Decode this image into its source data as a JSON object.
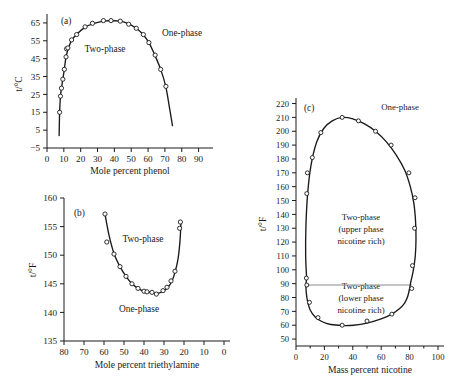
{
  "figure": {
    "caption": "",
    "panels": [
      "a",
      "b",
      "c"
    ]
  },
  "chart_data": [
    {
      "id": "a",
      "panel_label": "(a)",
      "type": "line",
      "title": "",
      "xlabel": "Mole percent phenol",
      "ylabel": "t/°C",
      "xlim": [
        0,
        95
      ],
      "ylim": [
        -5,
        70
      ],
      "xticks": [
        0,
        10,
        20,
        30,
        40,
        50,
        60,
        70,
        80,
        90
      ],
      "yticks": [
        -5,
        5,
        15,
        25,
        35,
        45,
        55,
        65
      ],
      "ytick_labels": [
        "−5",
        "5",
        "15",
        "25",
        "35",
        "45",
        "55",
        "65"
      ],
      "grid": false,
      "legend": "none",
      "annotations": [
        {
          "text": "Two-phase",
          "x": 32,
          "y": 46
        },
        {
          "text": "One-phase",
          "x": 74,
          "y": 55
        }
      ],
      "series": [
        {
          "name": "phenol-water coexistence curve",
          "x": [
            7.2,
            7.5,
            8.0,
            8.6,
            9.3,
            10.2,
            11.2,
            12.4,
            14.5,
            17.5,
            22.5,
            27.0,
            33.5,
            38.0,
            43.5,
            48.5,
            53.0,
            57.0,
            60.5,
            64.0,
            67.5,
            70.5,
            73.0,
            74.5
          ],
          "y": [
            2.0,
            15.0,
            24.0,
            28.5,
            33.0,
            38.5,
            45.5,
            50.0,
            55.0,
            58.5,
            62.5,
            64.5,
            66.0,
            66.2,
            66.0,
            64.5,
            62.0,
            58.5,
            54.0,
            47.0,
            39.0,
            29.5,
            16.0,
            7.5
          ]
        }
      ],
      "data_points": {
        "x": [
          7.5,
          8.0,
          8.6,
          9.4,
          10.3,
          11.3,
          11.6,
          12.4,
          14.6,
          17.6,
          22.6,
          27.0,
          33.5,
          38.0,
          43.5,
          48.5,
          53.0,
          57.2,
          60.5,
          64.2,
          67.5,
          70.6
        ],
        "y": [
          15.0,
          24.0,
          28.5,
          33.5,
          39.0,
          46.0,
          50.5,
          51.0,
          55.5,
          58.5,
          62.8,
          64.8,
          66.3,
          66.3,
          66.0,
          64.3,
          62.0,
          58.5,
          54.0,
          47.0,
          39.0,
          29.5
        ]
      }
    },
    {
      "id": "b",
      "panel_label": "(b)",
      "type": "line",
      "title": "",
      "xlabel": "Mole percent triethylamine",
      "ylabel": "t/°F",
      "xlim": [
        80,
        0
      ],
      "ylim": [
        135,
        160
      ],
      "xticks": [
        80,
        70,
        60,
        50,
        40,
        30,
        20,
        10,
        0
      ],
      "yticks": [
        135,
        140,
        145,
        150,
        155,
        160
      ],
      "x_axis_reversed": true,
      "grid": false,
      "legend": "none",
      "annotations": [
        {
          "text": "Two-phase",
          "x": 42,
          "y": 152.2
        },
        {
          "text": "One-phase",
          "x": 40,
          "y": 140.3
        }
      ],
      "series": [
        {
          "name": "triethylamine-water coexistence curve",
          "x": [
            59.5,
            57.5,
            55.0,
            52.0,
            49.0,
            46.0,
            43.0,
            40.0,
            36.5,
            33.5,
            30.5,
            28.0,
            26.0,
            24.5,
            23.0,
            22.0,
            21.5
          ],
          "y": [
            157.2,
            153.5,
            150.3,
            148.0,
            146.3,
            145.0,
            144.2,
            143.7,
            143.5,
            143.3,
            143.7,
            144.4,
            145.5,
            147.0,
            149.3,
            152.5,
            155.8
          ]
        }
      ],
      "data_points": {
        "x": [
          59.5,
          58.6,
          55.0,
          52.0,
          49.0,
          46.0,
          43.0,
          40.0,
          38.5,
          36.0,
          33.8,
          30.5,
          28.5,
          26.5,
          24.5,
          22.2,
          21.8
        ],
        "y": [
          157.2,
          152.3,
          150.2,
          148.0,
          146.3,
          145.0,
          144.2,
          143.7,
          143.6,
          143.5,
          143.2,
          143.8,
          144.4,
          145.5,
          147.2,
          154.7,
          155.8
        ]
      }
    },
    {
      "id": "c",
      "panel_label": "(c)",
      "type": "line",
      "title": "",
      "xlabel": "Mass percent nicotine",
      "ylabel": "t/°F",
      "xlim": [
        0,
        100
      ],
      "ylim": [
        45,
        224
      ],
      "xticks": [
        0,
        20,
        40,
        60,
        80,
        100
      ],
      "xminorticks": [
        10,
        30,
        50,
        70,
        90
      ],
      "yticks": [
        50,
        60,
        70,
        80,
        90,
        100,
        110,
        120,
        130,
        140,
        150,
        160,
        170,
        180,
        190,
        200,
        210,
        220
      ],
      "grid": false,
      "legend": "none",
      "annotations": [
        {
          "text": "One-phase",
          "x": 72,
          "y": 209
        },
        {
          "text": "Two-phase",
          "x": 44,
          "y": 132
        },
        {
          "text": "(upper phase",
          "x": 44,
          "y": 122
        },
        {
          "text": "nicotine rich)",
          "x": 44,
          "y": 113
        },
        {
          "text": "Two-phase",
          "x": 44,
          "y": 81
        },
        {
          "text": "(lower phase",
          "x": 44,
          "y": 72
        },
        {
          "text": "nicotine rich)",
          "x": 44,
          "y": 63
        }
      ],
      "tie_line": {
        "y": 89,
        "x_start": 7.5,
        "x_end": 81.5
      },
      "series": [
        {
          "name": "nicotine-water closed-loop coexistence curve",
          "x": [
            7.5,
            6.8,
            7.0,
            8.2,
            10.5,
            14.5,
            19.5,
            25.5,
            32.5,
            40.0,
            48.0,
            56.0,
            63.5,
            70.5,
            76.5,
            80.5,
            83.0,
            84.2,
            84.5,
            84.0,
            82.5,
            81.0,
            80.0,
            79.0,
            78.0,
            76.5,
            73.0,
            67.5,
            60.0,
            50.0,
            40.5,
            32.5,
            24.5,
            18.5,
            13.5,
            10.0,
            8.0,
            7.2,
            7.0,
            7.5
          ],
          "y": [
            94.0,
            110.0,
            132.0,
            155.0,
            175.0,
            192.0,
            202.0,
            207.5,
            210.0,
            209.0,
            205.5,
            200.0,
            192.5,
            183.0,
            172.0,
            160.0,
            148.0,
            135.0,
            122.0,
            110.0,
            99.0,
            92.0,
            86.5,
            82.0,
            79.0,
            76.0,
            72.0,
            68.0,
            64.5,
            61.5,
            60.0,
            59.8,
            60.5,
            62.5,
            66.0,
            71.0,
            78.0,
            84.0,
            89.0,
            94.0
          ]
        }
      ],
      "data_points": {
        "x": [
          7.3,
          7.6,
          7.6,
          8.0,
          11.5,
          17.5,
          32.5,
          44.0,
          56.0,
          67.0,
          79.5,
          83.8,
          83.5,
          82.0,
          81.5,
          67.5,
          50.0,
          32.5,
          15.5,
          9.5
        ],
        "y": [
          94.0,
          89.0,
          155.0,
          170.0,
          181.0,
          199.0,
          210.0,
          207.5,
          200.0,
          190.0,
          170.0,
          152.0,
          130.0,
          103.0,
          86.5,
          68.0,
          63.0,
          60.0,
          65.5,
          76.5
        ]
      }
    }
  ]
}
